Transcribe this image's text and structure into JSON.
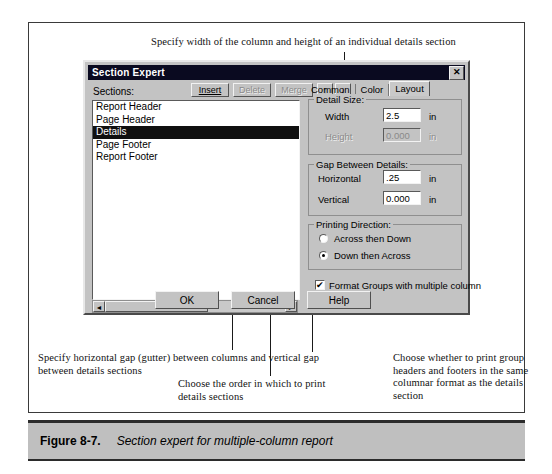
{
  "annotations": {
    "top": "Specify width of the column and height of an individual details section",
    "bottom_left": "Specify horizontal gap (gutter) between columns and vertical gap between details sections",
    "order": "Choose the order in which to print details sections",
    "bottom_right": "Choose whether to print group headers and footers in the same columnar format as the details section"
  },
  "dialog": {
    "title": "Section Expert",
    "close_label": "✕",
    "sections_label": "Sections:",
    "section_items": [
      {
        "label": "Report Header",
        "selected": false
      },
      {
        "label": "Page Header",
        "selected": false
      },
      {
        "label": "Details",
        "selected": true
      },
      {
        "label": "Page Footer",
        "selected": false
      },
      {
        "label": "Report Footer",
        "selected": false
      }
    ],
    "toolbar": {
      "insert": "Insert",
      "delete": "Delete",
      "merge": "Merge",
      "move_up": "↑",
      "move_down": "↓"
    },
    "scrollbar": {
      "left_arrow": "◄",
      "right_arrow": "►"
    },
    "tabs": [
      {
        "label": "Common",
        "active": false
      },
      {
        "label": "Color",
        "active": false
      },
      {
        "label": "Layout",
        "active": true
      }
    ],
    "detail_size": {
      "group_label": "Detail Size:",
      "width_label": "Width",
      "width_value": "2.5",
      "width_unit": "in",
      "height_label": "Height",
      "height_value": "0.000",
      "height_unit": "in"
    },
    "gap": {
      "group_label": "Gap Between Details:",
      "horizontal_label": "Horizontal",
      "horizontal_value": ".25",
      "horizontal_unit": "in",
      "vertical_label": "Vertical",
      "vertical_value": "0.000",
      "vertical_unit": "in"
    },
    "printing_direction": {
      "group_label": "Printing Direction:",
      "option_across": "Across then Down",
      "option_down": "Down then Across",
      "selected": "Down then Across"
    },
    "format_groups": {
      "label": "Format Groups with multiple column",
      "checked": true,
      "check_glyph": "✔"
    },
    "buttons": {
      "ok": "OK",
      "cancel": "Cancel",
      "help": "Help"
    }
  },
  "caption": {
    "figure": "Figure 8-7.",
    "text": "Section expert for multiple-column report"
  },
  "colors": {
    "dialog_face": "#c3c3c3",
    "titlebar": "#0a0a20",
    "selection": "#101010",
    "caption_band": "#bfbfbf",
    "rule": "#2b2b2b"
  }
}
